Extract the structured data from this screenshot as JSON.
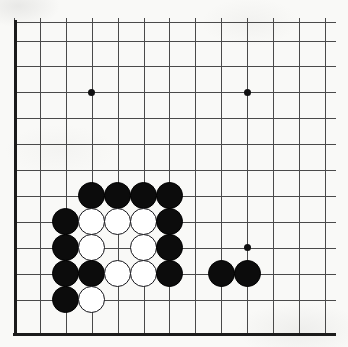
{
  "board": {
    "title": "Go board corner position",
    "background_color": "#f9f9f7",
    "line_color": "#4a4a4a",
    "border_color": "#1b1b1b",
    "black_stone_color": "#0c0c0c",
    "white_stone_color": "#ffffff",
    "grid_spacing": 25.9,
    "stone_diameter": 27,
    "origin_x": 14,
    "origin_y": 22,
    "vertical_lines_x": [
      14,
      39.9,
      65.8,
      91.7,
      117.6,
      143.5,
      169.4,
      195.3,
      221.2,
      247.1,
      273.0,
      298.9,
      324.8
    ],
    "horizontal_lines_y": [
      22,
      40.5,
      66.4,
      92.3,
      118.2,
      144.1,
      170.0,
      195.9,
      221.8,
      247.7,
      273.6,
      299.5,
      333.5
    ],
    "left_border": {
      "x": 14,
      "y_top": 20,
      "y_bottom": 335
    },
    "bottom_border": {
      "y": 333.5,
      "x_left": 13,
      "x_right": 336
    },
    "star_points": [
      {
        "name": "hoshi-upper-left",
        "x": 91.7,
        "y": 92.3
      },
      {
        "name": "hoshi-upper-right",
        "x": 247.1,
        "y": 92.3
      },
      {
        "name": "hoshi-lower-right",
        "x": 247.1,
        "y": 247.7
      }
    ],
    "stones": [
      {
        "name": "black-stone-1",
        "color": "black",
        "x": 91.7,
        "y": 195.9
      },
      {
        "name": "black-stone-2",
        "color": "black",
        "x": 117.6,
        "y": 195.9
      },
      {
        "name": "black-stone-3",
        "color": "black",
        "x": 143.5,
        "y": 195.9
      },
      {
        "name": "black-stone-4",
        "color": "black",
        "x": 169.4,
        "y": 195.9
      },
      {
        "name": "black-stone-5",
        "color": "black",
        "x": 65.8,
        "y": 221.8
      },
      {
        "name": "white-stone-1",
        "color": "white",
        "x": 91.7,
        "y": 221.8
      },
      {
        "name": "white-stone-2",
        "color": "white",
        "x": 117.6,
        "y": 221.8
      },
      {
        "name": "white-stone-3",
        "color": "white",
        "x": 143.5,
        "y": 221.8
      },
      {
        "name": "black-stone-6",
        "color": "black",
        "x": 169.4,
        "y": 221.8
      },
      {
        "name": "black-stone-7",
        "color": "black",
        "x": 65.8,
        "y": 247.7
      },
      {
        "name": "white-stone-4",
        "color": "white",
        "x": 91.7,
        "y": 247.7
      },
      {
        "name": "white-stone-5",
        "color": "white",
        "x": 143.5,
        "y": 247.7
      },
      {
        "name": "black-stone-8",
        "color": "black",
        "x": 169.4,
        "y": 247.7
      },
      {
        "name": "black-stone-9",
        "color": "black",
        "x": 65.8,
        "y": 273.6
      },
      {
        "name": "black-stone-10",
        "color": "black",
        "x": 91.7,
        "y": 273.6
      },
      {
        "name": "white-stone-6",
        "color": "white",
        "x": 117.6,
        "y": 273.6
      },
      {
        "name": "white-stone-7",
        "color": "white",
        "x": 143.5,
        "y": 273.6
      },
      {
        "name": "black-stone-11",
        "color": "black",
        "x": 169.4,
        "y": 273.6
      },
      {
        "name": "black-stone-12",
        "color": "black",
        "x": 221.2,
        "y": 273.6
      },
      {
        "name": "black-stone-13",
        "color": "black",
        "x": 247.1,
        "y": 273.6
      },
      {
        "name": "black-stone-14",
        "color": "black",
        "x": 65.8,
        "y": 299.5
      },
      {
        "name": "white-stone-8",
        "color": "white",
        "x": 91.7,
        "y": 299.5
      }
    ]
  }
}
